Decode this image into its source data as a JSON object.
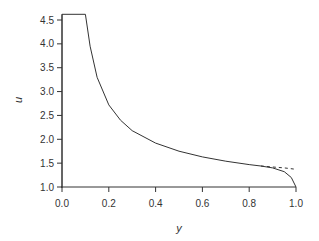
{
  "chart_data": {
    "type": "line",
    "title": "",
    "xlabel": "y",
    "ylabel": "u",
    "xlim": [
      0.0,
      1.0
    ],
    "ylim": [
      1.0,
      4.6
    ],
    "xticks": [
      "0.0",
      "0.2",
      "0.4",
      "0.6",
      "0.8",
      "1.0"
    ],
    "yticks": [
      "1.0",
      "1.5",
      "2.0",
      "2.5",
      "3.0",
      "3.5",
      "4.0",
      "4.5"
    ],
    "grid": false,
    "series": [
      {
        "name": "solid",
        "style": "solid",
        "x": [
          0.0,
          0.0,
          0.1,
          0.12,
          0.15,
          0.2,
          0.25,
          0.3,
          0.4,
          0.5,
          0.6,
          0.7,
          0.8,
          0.85,
          0.9,
          0.95,
          0.98,
          1.0
        ],
        "y": [
          1.0,
          4.62,
          4.62,
          3.95,
          3.3,
          2.72,
          2.4,
          2.18,
          1.92,
          1.75,
          1.63,
          1.54,
          1.47,
          1.44,
          1.4,
          1.32,
          1.2,
          1.0
        ]
      },
      {
        "name": "dashed",
        "style": "dashed",
        "x": [
          0.85,
          0.9,
          0.95,
          1.0
        ],
        "y": [
          1.44,
          1.42,
          1.4,
          1.37
        ]
      }
    ]
  }
}
